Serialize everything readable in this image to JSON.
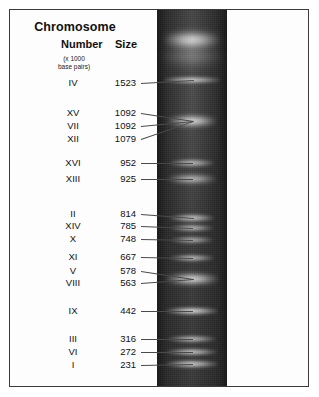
{
  "figure": {
    "type": "gel-electrophoresis-karyotype",
    "header": {
      "title": "Chromosome",
      "col_number": "Number",
      "col_size": "Size",
      "units_line1": "(x 1000",
      "units_line2": "base pairs)"
    },
    "colors": {
      "gel_background": "#2e2e2e",
      "band": "#f2f2f2",
      "frame": "#3a3a3a",
      "text": "#111111",
      "leader_line": "#4a4a4a"
    },
    "lane": {
      "label": "gel-lane",
      "well_label": "loading-well"
    }
  },
  "chart_data": {
    "type": "table",
    "title": "Chromosome",
    "xlabel": "",
    "ylabel": "Size (x 1000 base pairs)",
    "columns": [
      "Number",
      "Size"
    ],
    "units": "x 1000 base pairs",
    "categories": [
      "IV",
      "XV",
      "VII",
      "XII",
      "XVI",
      "XIII",
      "II",
      "XIV",
      "X",
      "XI",
      "V",
      "VIII",
      "IX",
      "III",
      "VI",
      "I"
    ],
    "values": [
      1523,
      1092,
      1092,
      1079,
      952,
      925,
      814,
      785,
      748,
      667,
      578,
      563,
      442,
      316,
      272,
      231
    ],
    "rows": [
      {
        "number": "IV",
        "size": "1523",
        "label_y": 83,
        "band_y": 80,
        "band_w": 58,
        "band_h": 7,
        "band_glow": 0.82
      },
      {
        "number": "XV",
        "size": "1092",
        "label_y": 113,
        "band_y": 121,
        "band_w": 48,
        "band_h": 11,
        "band_glow": 1.0
      },
      {
        "number": "VII",
        "size": "1092",
        "label_y": 126,
        "band_y": 121,
        "band_w": 48,
        "band_h": 11,
        "band_glow": 0.0
      },
      {
        "number": "XII",
        "size": "1079",
        "label_y": 139,
        "band_y": 121,
        "band_w": 48,
        "band_h": 11,
        "band_glow": 0.0
      },
      {
        "number": "XVI",
        "size": "952",
        "label_y": 163,
        "band_y": 163,
        "band_w": 44,
        "band_h": 8,
        "band_glow": 0.7
      },
      {
        "number": "XIII",
        "size": "925",
        "label_y": 179,
        "band_y": 179,
        "band_w": 48,
        "band_h": 9,
        "band_glow": 0.8
      },
      {
        "number": "II",
        "size": "814",
        "label_y": 214,
        "band_y": 218,
        "band_w": 44,
        "band_h": 8,
        "band_glow": 0.78
      },
      {
        "number": "XIV",
        "size": "785",
        "label_y": 226,
        "band_y": 228,
        "band_w": 42,
        "band_h": 7,
        "band_glow": 0.72
      },
      {
        "number": "X",
        "size": "748",
        "label_y": 239,
        "band_y": 240,
        "band_w": 42,
        "band_h": 7,
        "band_glow": 0.66
      },
      {
        "number": "XI",
        "size": "667",
        "label_y": 257,
        "band_y": 258,
        "band_w": 44,
        "band_h": 7,
        "band_glow": 0.74
      },
      {
        "number": "V",
        "size": "578",
        "label_y": 271,
        "band_y": 279,
        "band_w": 52,
        "band_h": 11,
        "band_glow": 1.0
      },
      {
        "number": "VIII",
        "size": "563",
        "label_y": 283,
        "band_y": 279,
        "band_w": 52,
        "band_h": 11,
        "band_glow": 0.0
      },
      {
        "number": "IX",
        "size": "442",
        "label_y": 311,
        "band_y": 311,
        "band_w": 52,
        "band_h": 8,
        "band_glow": 0.88
      },
      {
        "number": "III",
        "size": "316",
        "label_y": 339,
        "band_y": 339,
        "band_w": 48,
        "band_h": 7,
        "band_glow": 0.74
      },
      {
        "number": "VI",
        "size": "272",
        "label_y": 352,
        "band_y": 352,
        "band_w": 50,
        "band_h": 7,
        "band_glow": 0.8
      },
      {
        "number": "I",
        "size": "231",
        "label_y": 365,
        "band_y": 364,
        "band_w": 52,
        "band_h": 8,
        "band_glow": 0.82
      }
    ],
    "extra_bands": [
      {
        "name": "loading-well",
        "band_y": 40,
        "band_w": 56,
        "band_h": 16,
        "band_glow": 1.0
      },
      {
        "name": "well-smear",
        "band_y": 56,
        "band_w": 62,
        "band_h": 20,
        "band_glow": 0.35
      }
    ],
    "grid": false,
    "legend": "none"
  }
}
